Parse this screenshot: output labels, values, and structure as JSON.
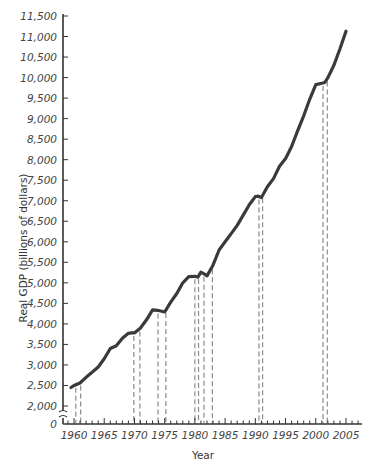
{
  "chart_data": {
    "type": "line",
    "title": "",
    "xlabel": "Year",
    "ylabel": "Real GDP (billions of dollars)",
    "xlim": [
      1958,
      2008
    ],
    "ylim": [
      0,
      11500
    ],
    "y_axis_break": "between 0 and 2,000",
    "grid": false,
    "legend": null,
    "x_ticks": [
      1960,
      1965,
      1970,
      1975,
      1980,
      1985,
      1990,
      1995,
      2000,
      2005
    ],
    "x_tick_labels": [
      "1960",
      "1965",
      "1970",
      "1975",
      "1980",
      "1985",
      "1990",
      "1995",
      "2000",
      "2005"
    ],
    "y_ticks": [
      0,
      2000,
      2500,
      3000,
      3500,
      4000,
      4500,
      5000,
      5500,
      6000,
      6500,
      7000,
      7500,
      8000,
      8500,
      9000,
      9500,
      10000,
      10500,
      11000,
      11500
    ],
    "y_tick_labels": [
      "0",
      "2,000",
      "2,500",
      "3,000",
      "3,500",
      "4,000",
      "4,500",
      "5,000",
      "5,500",
      "6,000",
      "6,500",
      "7,000",
      "7,500",
      "8,000",
      "8,500",
      "9,000",
      "9,500",
      "10,000",
      "10,500",
      "11,000",
      "11,500"
    ],
    "series": [
      {
        "name": "Real GDP",
        "x": [
          1959.5,
          1960,
          1960.5,
          1961,
          1962,
          1963,
          1964,
          1965,
          1966,
          1967,
          1968,
          1969,
          1969.5,
          1970,
          1971,
          1972,
          1973,
          1973.8,
          1974.5,
          1975,
          1976,
          1977,
          1978,
          1979,
          1980,
          1980.5,
          1981,
          1981.5,
          1982,
          1983,
          1984,
          1985,
          1986,
          1987,
          1988,
          1989,
          1990,
          1990.5,
          1991,
          1992,
          1993,
          1994,
          1995,
          1996,
          1997,
          1998,
          1999,
          2000,
          2001,
          2001.5,
          2002,
          2003,
          2004,
          2005
        ],
        "values": [
          2450,
          2500,
          2530,
          2560,
          2700,
          2820,
          2950,
          3150,
          3400,
          3470,
          3650,
          3770,
          3780,
          3780,
          3900,
          4100,
          4340,
          4330,
          4310,
          4290,
          4530,
          4740,
          5000,
          5150,
          5160,
          5140,
          5260,
          5220,
          5170,
          5430,
          5800,
          6000,
          6200,
          6400,
          6650,
          6900,
          7100,
          7110,
          7080,
          7340,
          7540,
          7840,
          8030,
          8320,
          8700,
          9070,
          9470,
          9830,
          9860,
          9880,
          10000,
          10300,
          10700,
          11130
        ]
      }
    ],
    "recessions": [
      {
        "start": 1960.3,
        "end": 1961.1
      },
      {
        "start": 1969.9,
        "end": 1970.9
      },
      {
        "start": 1973.9,
        "end": 1975.2
      },
      {
        "start": 1980.0,
        "end": 1980.6
      },
      {
        "start": 1981.5,
        "end": 1982.9
      },
      {
        "start": 1990.6,
        "end": 1991.2
      },
      {
        "start": 2001.2,
        "end": 2001.9
      }
    ],
    "colors": {
      "line": "#3a3a3a",
      "recession_dash": "#8a8a8a",
      "axis": "#333333"
    }
  }
}
